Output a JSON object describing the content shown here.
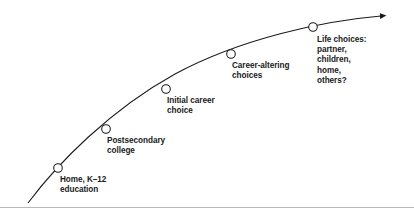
{
  "diagram": {
    "type": "life-career-progression-curve",
    "title_visible": false,
    "colors": {
      "curve": "#1a1a1a",
      "node_fill": "#ffffff",
      "node_stroke": "#1a1a1a",
      "text": "#1a1a1a",
      "rule": "#b9b9b9",
      "background": "#ffffff"
    },
    "arrow": {
      "name": "arrow-head",
      "direction": "right",
      "x": 388,
      "y": 15
    },
    "curve": {
      "name": "progression-curve",
      "path": "M 28,203 C 60,160 110,108 175,74 C 240,40 320,22 382,16",
      "points": [
        {
          "x": 28,
          "y": 203
        },
        {
          "x": 58,
          "y": 168
        },
        {
          "x": 106,
          "y": 129
        },
        {
          "x": 166,
          "y": 89
        },
        {
          "x": 231,
          "y": 54
        },
        {
          "x": 313,
          "y": 27
        },
        {
          "x": 382,
          "y": 16
        }
      ]
    },
    "nodes": [
      {
        "id": "home-k12-education",
        "label": "Home, K–12\neducation",
        "cx": 58,
        "cy": 168,
        "r": 4.3,
        "label_x": 60,
        "label_y": 175
      },
      {
        "id": "postsecondary-college",
        "label": "Postsecondary\ncollege",
        "cx": 106,
        "cy": 129,
        "r": 4.3,
        "label_x": 107,
        "label_y": 136
      },
      {
        "id": "initial-career-choice",
        "label": "Initial career\nchoice",
        "cx": 166,
        "cy": 89,
        "r": 4.3,
        "label_x": 167,
        "label_y": 96
      },
      {
        "id": "career-altering-choices",
        "label": "Career-altering\nchoices",
        "cx": 231,
        "cy": 54,
        "r": 4.3,
        "label_x": 232,
        "label_y": 61
      },
      {
        "id": "life-choices",
        "label": "Life choices:\npartner,\nchildren,\nhome,\nothers?",
        "cx": 313,
        "cy": 27,
        "r": 4.3,
        "label_x": 317,
        "label_y": 35
      }
    ],
    "bottom_rule": {
      "name": "footer-divider",
      "y": 207
    }
  }
}
